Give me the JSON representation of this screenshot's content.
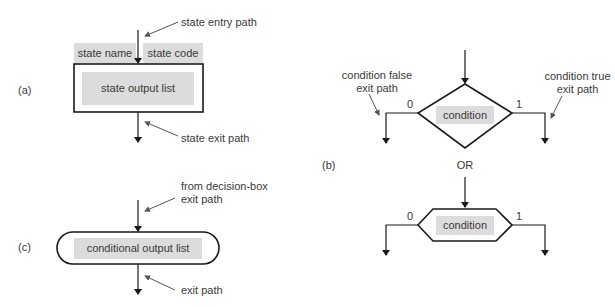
{
  "panel_a": {
    "label": "(a)",
    "entry_annotation": "state entry path",
    "state_name": "state name",
    "state_code": "state code",
    "state_output_list": "state output list",
    "exit_annotation": "state exit path"
  },
  "panel_b": {
    "label": "(b)",
    "false_annotation_line1": "condition false",
    "false_annotation_line2": "exit path",
    "true_annotation_line1": "condition true",
    "true_annotation_line2": "exit path",
    "diamond_condition": "condition",
    "zero_label": "0",
    "one_label": "1",
    "or_label": "OR",
    "hex_condition": "condition",
    "hex_zero_label": "0",
    "hex_one_label": "1"
  },
  "panel_c": {
    "label": "(c)",
    "entry_annotation_line1": "from decision-box",
    "entry_annotation_line2": "exit path",
    "conditional_output_list": "conditional output list",
    "exit_annotation": "exit path"
  },
  "colors": {
    "line": "#1a1a1a",
    "fill": "#dcdcdc",
    "pointer": "#555555"
  }
}
